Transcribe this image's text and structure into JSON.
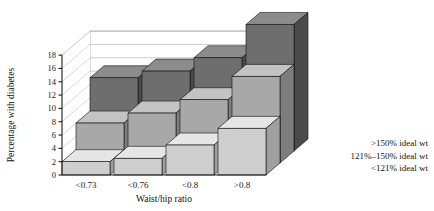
{
  "chart_data": {
    "type": "bar",
    "title": "",
    "xlabel": "Waist/hip ratio",
    "ylabel": "Percentage with diabetes",
    "categories": [
      "<0.73",
      "<0.76",
      "<0.8",
      ">0.8"
    ],
    "series": [
      {
        "name": "<121% ideal wt",
        "values": [
          2,
          2.5,
          4.5,
          7
        ]
      },
      {
        "name": "121%–150% ideal wt",
        "values": [
          6,
          7.5,
          9.5,
          13
        ]
      },
      {
        "name": ">150% ideal wt",
        "values": [
          11,
          12,
          14,
          19
        ]
      }
    ],
    "ylim": [
      0,
      18
    ],
    "yticks": [
      0,
      2,
      4,
      6,
      8,
      10,
      12,
      14,
      16,
      18
    ],
    "ytick_labels": [
      "0",
      "2",
      "4",
      "6",
      "8",
      "10",
      "12",
      "14",
      "16",
      "18"
    ],
    "grid": true,
    "legend_position": "right-bottom",
    "projection": "3d-stepped",
    "colors": {
      "series_front": [
        "#cfcfcf",
        "#a8a8a8",
        "#6e6e6e"
      ],
      "series_top": [
        "#e6e6e6",
        "#c3c3c3",
        "#8c8c8c"
      ],
      "series_side": [
        "#9f9f9f",
        "#7d7d7d",
        "#4a4a4a"
      ],
      "axis": "#1a1a1a",
      "grid": "#b9b9b9",
      "background": "#ffffff"
    }
  },
  "legend": {
    "items": [
      {
        "label": ">150% ideal wt"
      },
      {
        "label": "121%–150% ideal wt"
      },
      {
        "label": "<121% ideal wt"
      }
    ]
  }
}
